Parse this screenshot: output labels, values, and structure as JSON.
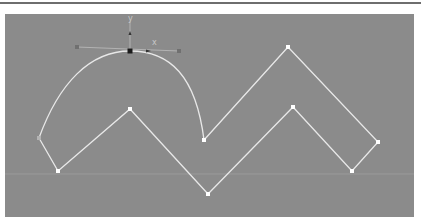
{
  "viewport": {
    "background": "#8b8b8b",
    "grid_line_y": 174,
    "grid_color": "#9a9a9a"
  },
  "spline": {
    "color": "#e8e8e8",
    "vertex_color": "#ffffff",
    "selected_vertex_color": "#1a1a1a",
    "start_vertex_color": "#b4b4b4",
    "curve_segment": {
      "from": [
        39,
        138
      ],
      "peak": [
        130,
        51
      ],
      "to": [
        204,
        140
      ]
    },
    "vertices": [
      {
        "x": 39,
        "y": 138,
        "type": "start"
      },
      {
        "x": 130,
        "y": 51,
        "type": "selected"
      },
      {
        "x": 204,
        "y": 140,
        "type": "corner"
      },
      {
        "x": 288,
        "y": 47,
        "type": "corner"
      },
      {
        "x": 378,
        "y": 142,
        "type": "corner"
      },
      {
        "x": 352,
        "y": 171,
        "type": "corner"
      },
      {
        "x": 293,
        "y": 107,
        "type": "corner"
      },
      {
        "x": 208,
        "y": 194,
        "type": "corner"
      },
      {
        "x": 130,
        "y": 109,
        "type": "corner"
      },
      {
        "x": 58,
        "y": 171,
        "type": "corner"
      }
    ]
  },
  "gizmo": {
    "origin": [
      130,
      51
    ],
    "x_label": "x",
    "y_label": "y",
    "tangent_handle_left": [
      77,
      47
    ],
    "tangent_handle_right": [
      179,
      51
    ],
    "axis_color": "#bdbdbd"
  }
}
